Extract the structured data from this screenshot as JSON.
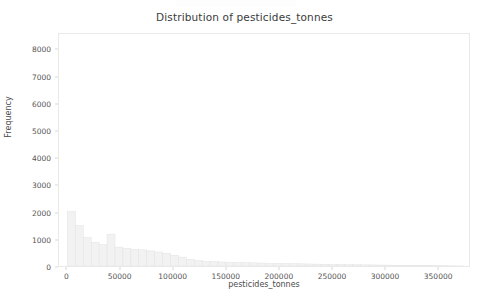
{
  "chart_data": {
    "type": "bar",
    "subtype": "histogram",
    "title": "Distribution of pesticides_tonnes",
    "xlabel": "pesticides_tonnes",
    "ylabel": "Frequency",
    "grid": false,
    "legend": null,
    "xlim": [
      -8000,
      380000
    ],
    "ylim": [
      0,
      8600
    ],
    "xticks": [
      0,
      50000,
      100000,
      150000,
      200000,
      250000,
      300000,
      350000
    ],
    "xtick_labels": [
      "0",
      "50000",
      "100000",
      "150000",
      "200000",
      "250000",
      "300000",
      "350000"
    ],
    "yticks": [
      0,
      1000,
      2000,
      3000,
      4000,
      5000,
      6000,
      7000,
      8000
    ],
    "ytick_labels": [
      "0",
      "1000",
      "2000",
      "3000",
      "4000",
      "5000",
      "6000",
      "7000",
      "8000"
    ],
    "bar_color": "#f2f2f2",
    "bar_edge_color": "#e3e3e3",
    "bin_width": 7500,
    "bin_left_edges": [
      0,
      7500,
      15000,
      22500,
      30000,
      37500,
      45000,
      52500,
      60000,
      67500,
      75000,
      82500,
      90000,
      97500,
      105000,
      112500,
      120000,
      127500,
      135000,
      142500,
      150000,
      157500,
      165000,
      172500,
      180000,
      187500,
      195000,
      202500,
      210000,
      217500,
      225000,
      232500,
      240000,
      247500,
      255000,
      262500,
      270000,
      277500,
      285000,
      292500,
      300000,
      307500,
      315000,
      322500,
      330000,
      337500,
      345000,
      352500,
      360000,
      367500
    ],
    "values": [
      2020,
      1500,
      1060,
      880,
      790,
      1180,
      700,
      660,
      620,
      600,
      560,
      520,
      470,
      400,
      330,
      250,
      200,
      175,
      160,
      150,
      140,
      132,
      124,
      118,
      110,
      104,
      98,
      92,
      86,
      80,
      75,
      70,
      65,
      60,
      56,
      52,
      48,
      44,
      40,
      36,
      32,
      28,
      25,
      22,
      19,
      16,
      13,
      10,
      7,
      4
    ]
  },
  "axes": {
    "title": "Distribution of pesticides_tonnes",
    "y_axis_label": "Frequency",
    "x_axis_label": "pesticides_tonnes"
  }
}
